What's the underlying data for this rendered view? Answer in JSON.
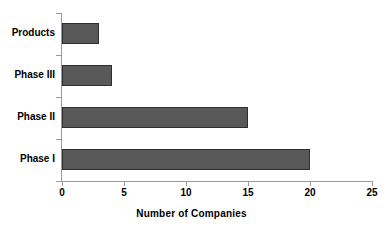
{
  "chart_data": {
    "type": "bar",
    "orientation": "horizontal",
    "title": "",
    "xlabel": "Number of Companies",
    "ylabel": "",
    "categories": [
      "Phase I",
      "Phase II",
      "Phase III",
      "Products"
    ],
    "values": [
      20,
      15,
      4,
      3
    ],
    "series": [
      {
        "name": "Number of Companies",
        "values": [
          20,
          15,
          4,
          3
        ]
      }
    ],
    "xlim": [
      0,
      25
    ],
    "xticks": [
      0,
      5,
      10,
      15,
      20,
      25
    ],
    "xtick_labels": [
      "0",
      "5",
      "10",
      "15",
      "20",
      "25"
    ],
    "grid": false,
    "legend": false,
    "bar_color": "#595959",
    "bar_border_color": "#2f2f2f",
    "axis_color": "#9a9a9a",
    "text_color": "#000000",
    "background": "#ffffff"
  },
  "labels": {
    "cat_products": "Products",
    "cat_phase3": "Phase III",
    "cat_phase2": "Phase II",
    "cat_phase1": "Phase I",
    "tick_0": "0",
    "tick_5": "5",
    "tick_10": "10",
    "tick_15": "15",
    "tick_20": "20",
    "tick_25": "25",
    "x_axis_title": "Number of Companies"
  }
}
